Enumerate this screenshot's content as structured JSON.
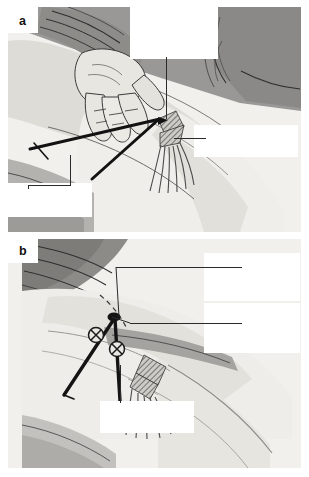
{
  "figure": {
    "background_color": "#ffffff",
    "plate_color": "#f3f2f0"
  },
  "panels": [
    {
      "id": "a",
      "letter": "a",
      "caption": "Palpation of bony landmarks, posterior view of gluteal region",
      "labels": [
        {
          "name": "inferior-lateral-angle-of-sacrum",
          "text": "Inferior\nlateral angle\nof the sacrum",
          "align": "left"
        },
        {
          "name": "ischial-tuberosity",
          "text": "Ischial\ntuberosity",
          "align": "left"
        },
        {
          "name": "greater-trochanter",
          "text": "Greater\ntrochanter",
          "align": "left"
        }
      ]
    },
    {
      "id": "b",
      "letter": "b",
      "caption": "Needle insertion points relative to the piriformis foramina",
      "labels": [
        {
          "name": "suprapiriform-foramen",
          "text": "Supra-\npiriform\nforamen",
          "align": "right"
        },
        {
          "name": "posterior-superior-iliac-spine",
          "text": "Posterior\nsuperior\niliac spine",
          "align": "right"
        },
        {
          "name": "infrapiriform-foramen",
          "text": "Infrapiriform\nforamen",
          "align": "left"
        }
      ]
    }
  ],
  "colors": {
    "skin_light": "#efeeea",
    "skin_mid": "#d9d7d2",
    "skin_shadow": "#b9b7b2",
    "drape_dark": "#8f8d8a",
    "drape_darker": "#7b7976",
    "ink": "#161616",
    "marker": "#1a1a1a"
  },
  "markers": {
    "crossed_circle_count": 2,
    "apex_point_label": "posterior superior iliac spine"
  }
}
